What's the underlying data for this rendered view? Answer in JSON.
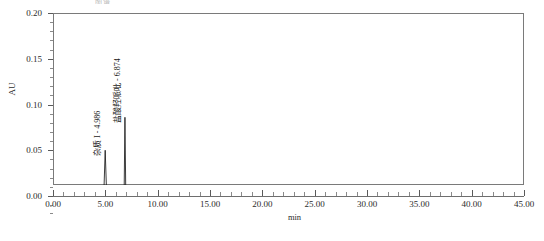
{
  "figure": {
    "clipped_title": "图谱",
    "background_color": "#ffffff",
    "frame_color": "#7a7a7a",
    "trace_color": "#1a1a1a"
  },
  "chart_data": {
    "type": "line",
    "title": "",
    "xlabel": "min",
    "ylabel": "AU",
    "xlim": [
      0.0,
      45.0
    ],
    "ylim": [
      0.0,
      0.2
    ],
    "grid": false,
    "legend": "none",
    "x_ticks": [
      "0.00",
      "5.00",
      "10.00",
      "15.00",
      "20.00",
      "25.00",
      "30.00",
      "35.00",
      "40.00",
      "45.00"
    ],
    "x_tick_values": [
      0,
      5,
      10,
      15,
      20,
      25,
      30,
      35,
      40,
      45
    ],
    "x_minor_per_major": 5,
    "y_ticks": [
      "0.00",
      "0.05",
      "0.10",
      "0.15",
      "0.20"
    ],
    "y_tick_values": [
      0.0,
      0.05,
      0.1,
      0.15,
      0.2
    ],
    "y_minor_per_major": 5,
    "series": [
      {
        "name": "UV chromatogram",
        "x": [
          0.0,
          4.0,
          4.6,
          4.86,
          4.986,
          5.12,
          5.4,
          6.0,
          6.55,
          6.8,
          6.874,
          6.95,
          7.2,
          7.9,
          13.0,
          13.4,
          45.0
        ],
        "y": [
          0.0,
          0.0,
          0.0,
          0.004,
          0.05,
          0.004,
          0.0,
          0.0,
          0.0,
          0.006,
          0.086,
          0.006,
          0.0,
          0.0,
          0.0,
          0.001,
          0.001
        ]
      }
    ],
    "peaks": [
      {
        "label": "杂质 I - 4.986",
        "retention_time": 4.986,
        "height_au": 0.05,
        "integration_marker": "baseline-triangle"
      },
      {
        "label": "盐酸羟哌吡 - 6.874",
        "retention_time": 6.874,
        "height_au": 0.086,
        "integration_marker": "baseline-triangle"
      }
    ],
    "baseline_au": 0.0
  }
}
